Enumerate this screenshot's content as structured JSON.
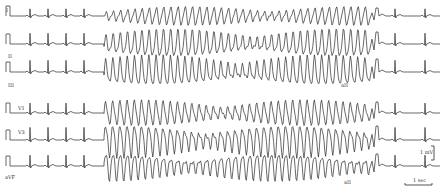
{
  "figure": {
    "type": "ECG rhythm strip",
    "leads": [
      {
        "label": "I",
        "baseline_y": 16,
        "label_x": 6,
        "label_y": 8,
        "amp": 8
      },
      {
        "label": "II",
        "baseline_y": 44,
        "label_x": 8,
        "label_y": 54,
        "amp": 12
      },
      {
        "label": "III",
        "baseline_y": 72,
        "label_x": 8,
        "label_y": 83,
        "amp": 13
      },
      {
        "label": "V1",
        "baseline_y": 113,
        "label_x": 18,
        "label_y": 106,
        "amp": 11
      },
      {
        "label": "V3",
        "baseline_y": 140,
        "label_x": 18,
        "label_y": 130,
        "amp": 14
      },
      {
        "label": "aVF",
        "baseline_y": 166,
        "label_x": 5,
        "label_y": 175,
        "amp": 12
      }
    ],
    "episode": {
      "start_x": 104,
      "end_x": 370
    },
    "sinus_beats_before": [
      30,
      48,
      66,
      84
    ],
    "sinus_beats_after": [
      395,
      425
    ],
    "mid_annotations": [
      {
        "text": "aII",
        "x": 341,
        "y": 83
      },
      {
        "text": "aII",
        "x": 344,
        "y": 180
      }
    ],
    "scale": {
      "voltage_label": "1 mV",
      "time_label": "1 sec"
    },
    "stroke_color": "#2a2a2a"
  }
}
